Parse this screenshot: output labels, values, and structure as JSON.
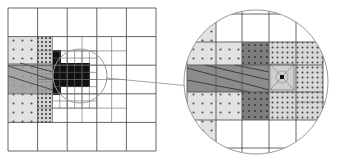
{
  "figure": {
    "colors": {
      "background": "#ffffff",
      "grid_line": "#555555",
      "light_dotted_fill": "#e2e2e2",
      "dense_dotted_fill": "#d0d0d0",
      "dark_block": "#111111",
      "hatched_band": "#9a9a9a",
      "mid_gray_block": "#7a7a7a",
      "dot": "#555555",
      "magnifier_circle": "#999999",
      "connector_line": "#999999"
    }
  },
  "left_panel": {
    "outer": {
      "x": 8,
      "y": 8,
      "w": 148,
      "h": 143,
      "cols": 5,
      "rows": 5
    },
    "light_dotted": {
      "x": 8,
      "y": 37,
      "w": 29,
      "h": 86
    },
    "dense_dotted": {
      "x": 37,
      "y": 37,
      "w": 16,
      "h": 86
    },
    "hatched_band": {
      "x": 8,
      "y": 63,
      "w": 45,
      "h": 30
    },
    "dark_blocks": [
      {
        "x": 53,
        "y": 50,
        "w": 8,
        "h": 45
      },
      {
        "x": 61,
        "y": 63,
        "w": 29,
        "h": 24
      }
    ],
    "focus_circle": {
      "cx": 80,
      "cy": 76,
      "r": 27
    }
  },
  "connector": {
    "x1": 106,
    "y1": 78,
    "x2": 190,
    "y2": 86
  },
  "right_panel": {
    "circle": {
      "cx": 256,
      "cy": 82,
      "r": 72
    },
    "light_dotted": [
      {
        "x": 187,
        "y": 42,
        "w": 55,
        "h": 78
      }
    ],
    "mid_gray": [
      {
        "x": 242,
        "y": 42,
        "w": 27,
        "h": 78
      }
    ],
    "dense_dotted": {
      "x": 269,
      "y": 42,
      "w": 54,
      "h": 78
    },
    "hatched_band": {
      "x": 187,
      "y": 65,
      "w": 82,
      "h": 27
    },
    "focus_cell": {
      "x": 270,
      "y": 64,
      "w": 24,
      "h": 26
    }
  }
}
